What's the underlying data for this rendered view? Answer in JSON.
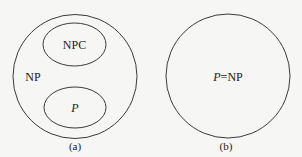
{
  "diagram": {
    "panel_a": {
      "outer_label": "NP",
      "npc_label": "NPC",
      "p_label": "P",
      "caption": "(a)"
    },
    "panel_b": {
      "label_p": "P",
      "label_eq": "=NP",
      "caption": "(b)"
    },
    "colors": {
      "background": "#f6f6f4",
      "stroke": "#3a3a3a",
      "text": "#1a1a1a"
    }
  }
}
